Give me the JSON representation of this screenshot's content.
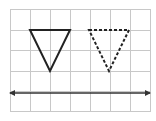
{
  "diagram": {
    "grid": {
      "x0": 10,
      "y0": 9,
      "cols": 7,
      "rows": 5,
      "cell_w": 20,
      "cell_h": 20.4,
      "line_color": "#c8c8c8"
    },
    "shapes": {
      "original_triangle": {
        "style": "solid",
        "color": "#222222",
        "points": "30,30 70,30 50,71"
      },
      "image_triangle": {
        "style": "dashed",
        "color": "#222222",
        "points": "89,30 129,30 109,71"
      }
    },
    "line": {
      "style": "double-arrow",
      "color": "#333333",
      "x1": 9,
      "x2": 151,
      "y": 93
    }
  }
}
